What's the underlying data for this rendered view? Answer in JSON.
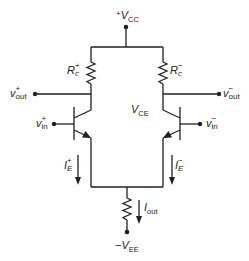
{
  "diagram": {
    "type": "differential-pair-circuit",
    "supply_top": {
      "sign": "+",
      "symbol": "V",
      "subscript": "CC"
    },
    "supply_bottom": {
      "sign": "−",
      "symbol": "V",
      "subscript": "EE"
    },
    "resistor_left": {
      "symbol": "R",
      "sub": "c",
      "sup": "+"
    },
    "resistor_right": {
      "symbol": "R",
      "sub": "c",
      "sup": "−"
    },
    "output_left": {
      "symbol": "v",
      "sub": "out",
      "sup": "+"
    },
    "output_right": {
      "symbol": "v",
      "sub": "out",
      "sup": "−"
    },
    "input_left": {
      "symbol": "v",
      "sub": "in",
      "sup": "+"
    },
    "input_right": {
      "symbol": "v",
      "sub": "in",
      "sup": "−"
    },
    "center_label": {
      "symbol": "V",
      "subscript": "CE"
    },
    "current_left": {
      "symbol": "I",
      "sub": "E",
      "sup": "+"
    },
    "current_right": {
      "symbol": "I",
      "sub": "E",
      "sup": "−"
    },
    "current_tail": {
      "symbol": "I",
      "subscript": "out"
    },
    "colors": {
      "ink": "#231f20",
      "background": "#ffffff"
    }
  }
}
